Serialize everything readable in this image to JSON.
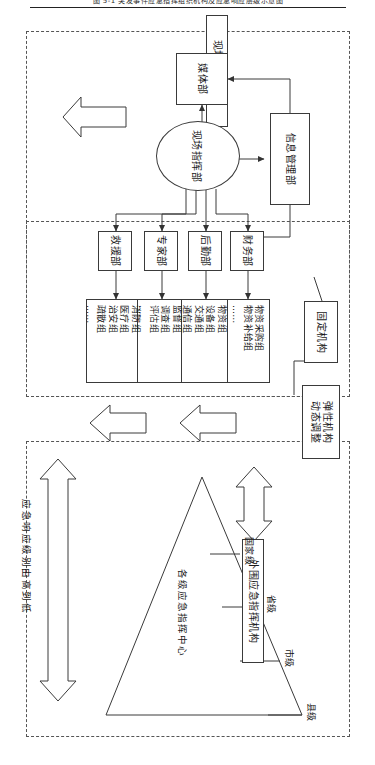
{
  "figure": {
    "caption": "图 5-1   突发事件应急指挥组织机构及应急响应层级示意图"
  },
  "panels": {
    "upper_label": "现场应急指挥组织机构",
    "lower_label": "各级应急指挥中心层级"
  },
  "left_column": {
    "onsite_agency": "现场处置机构",
    "external_agency": "外围应急指挥机构"
  },
  "core": {
    "media_dept": "媒体部",
    "info_dept": "信息管理部",
    "command_center": "现场指挥部"
  },
  "departments": [
    {
      "name": "财务部"
    },
    {
      "name": "后勤部"
    },
    {
      "name": "专家部"
    },
    {
      "name": "救援部"
    }
  ],
  "groups": [
    {
      "items": [
        "物资采购组",
        "物资补给组",
        "……"
      ]
    },
    {
      "items": [
        "物资组",
        "设备组",
        "交通组",
        "通信组",
        "饮食组"
      ]
    },
    {
      "items": [
        "监督组",
        "调查组",
        "评估组",
        "……"
      ]
    },
    {
      "items": [
        "消防组",
        "医疗组",
        "治安组",
        "疏散组",
        "……"
      ]
    }
  ],
  "annotations": {
    "fixed_org": "固定机构",
    "flexible_org": "弹性机构\n动态调整"
  },
  "hierarchy": {
    "center_label": "各级应急指挥中心",
    "levels": [
      "国家级",
      "省级",
      "市级",
      "县级"
    ],
    "response_label": "应急响应级别由高到低"
  },
  "colors": {
    "line": "#3a3a3a",
    "dashed": "#555555",
    "background": "#ffffff",
    "text": "#1a1a1a"
  }
}
